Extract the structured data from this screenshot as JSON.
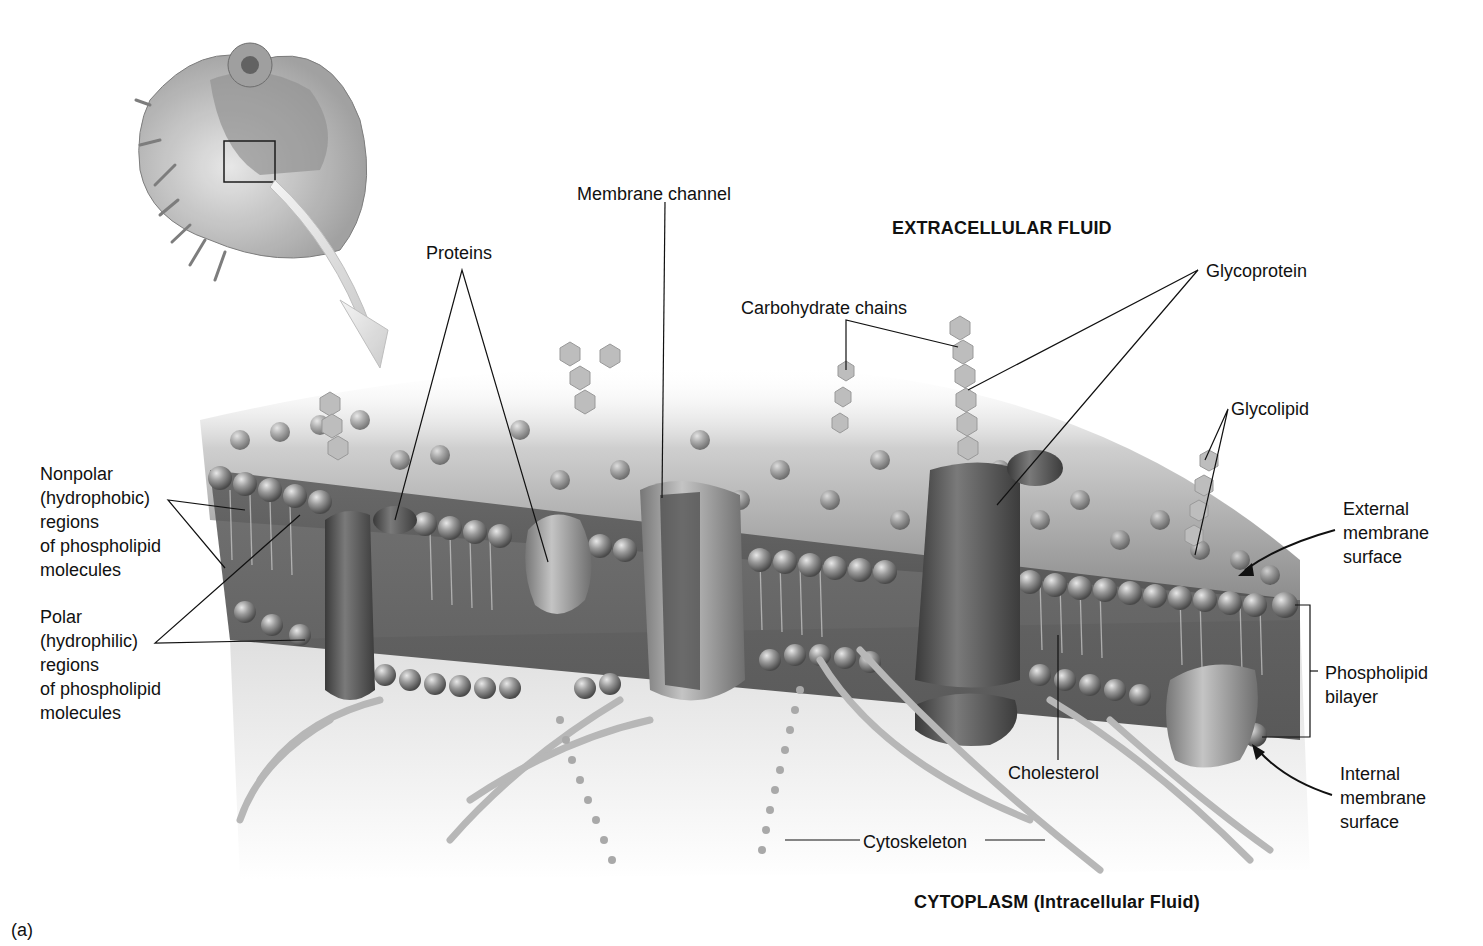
{
  "figure": {
    "panel_label": "(a)",
    "page_mark": "",
    "regions": {
      "top": "EXTRACELLULAR FLUID",
      "bottom": "CYTOPLASM (Intracellular Fluid)"
    },
    "inset": {
      "description": "cutaway cell with boxed region of plasma membrane, arrow pointing to magnified view"
    },
    "labels": {
      "proteins": "Proteins",
      "membrane_channel": "Membrane channel",
      "carbohydrate_chains": "Carbohydrate chains",
      "glycoprotein": "Glycoprotein",
      "glycolipid": "Glycolipid",
      "external_surface": "External\nmembrane\nsurface",
      "phospholipid_bilayer": "Phospholipid\nbilayer",
      "internal_surface": "Internal\nmembrane\nsurface",
      "nonpolar": "Nonpolar\n(hydrophobic)\nregions\nof phospholipid\nmolecules",
      "polar": "Polar\n(hydrophilic)\nregions\nof phospholipid\nmolecules",
      "cholesterol": "Cholesterol",
      "cytoskeleton": "Cytoskeleton"
    },
    "colors": {
      "background": "#ffffff",
      "text": "#111111",
      "membrane_head": "#8a8a8a",
      "protein_dark": "#555555",
      "protein_light": "#9a9a9a",
      "cytoskeleton": "#b5b5b5"
    }
  }
}
